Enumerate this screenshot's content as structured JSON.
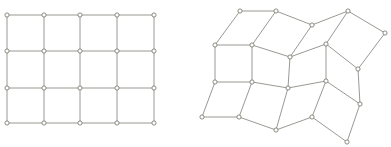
{
  "figure": {
    "title": "Regular grid mesh and its deformed counterpart",
    "background_color": "#ffffff",
    "edge_color": "#8d8d87",
    "node_stroke_color": "#78786f",
    "node_fill_color": "#ffffff",
    "node_radius": 2.1,
    "edge_width": 0.9,
    "width": 391,
    "height": 147
  },
  "panels": [
    {
      "id": "undeformed-grid",
      "label": "Undeformed regular grid",
      "rows": 4,
      "cols": 5,
      "cells": "4 x 3",
      "node_count": 20,
      "nodes": [
        [
          7,
          15
        ],
        [
          44,
          15
        ],
        [
          80,
          15
        ],
        [
          117,
          15
        ],
        [
          154,
          15
        ],
        [
          7,
          51
        ],
        [
          44,
          51
        ],
        [
          80,
          51
        ],
        [
          117,
          51
        ],
        [
          154,
          51
        ],
        [
          7,
          88
        ],
        [
          44,
          88
        ],
        [
          80,
          88
        ],
        [
          117,
          88
        ],
        [
          154,
          88
        ],
        [
          7,
          123
        ],
        [
          44,
          123
        ],
        [
          80,
          123
        ],
        [
          117,
          123
        ],
        [
          154,
          123
        ]
      ]
    },
    {
      "id": "deformed-grid",
      "label": "Deformed warped grid",
      "rows": 4,
      "cols": 5,
      "cells": "4 x 3",
      "node_count": 20,
      "nodes": [
        [
          240,
          11
        ],
        [
          276,
          11
        ],
        [
          312,
          25
        ],
        [
          348,
          11
        ],
        [
          385,
          33
        ],
        [
          215,
          45
        ],
        [
          252,
          45
        ],
        [
          290,
          57
        ],
        [
          326,
          44
        ],
        [
          358,
          69
        ],
        [
          215,
          82
        ],
        [
          252,
          82
        ],
        [
          288,
          88
        ],
        [
          326,
          81
        ],
        [
          360,
          104
        ],
        [
          202,
          117
        ],
        [
          239,
          117
        ],
        [
          276,
          130
        ],
        [
          312,
          117
        ],
        [
          347,
          142
        ]
      ]
    }
  ],
  "chart_data": {
    "type": "scatter",
    "title": "Regular grid mesh and its deformed counterpart",
    "xlabel": "",
    "ylabel": "",
    "xlim": [
      0,
      391
    ],
    "ylim": [
      0,
      147
    ],
    "grid": false,
    "legend": "none",
    "series": [
      {
        "name": "Undeformed regular grid",
        "values": [
          [
            7,
            15
          ],
          [
            44,
            15
          ],
          [
            80,
            15
          ],
          [
            117,
            15
          ],
          [
            154,
            15
          ],
          [
            7,
            51
          ],
          [
            44,
            51
          ],
          [
            80,
            51
          ],
          [
            117,
            51
          ],
          [
            154,
            51
          ],
          [
            7,
            88
          ],
          [
            44,
            88
          ],
          [
            80,
            88
          ],
          [
            117,
            88
          ],
          [
            154,
            88
          ],
          [
            7,
            123
          ],
          [
            44,
            123
          ],
          [
            80,
            123
          ],
          [
            117,
            123
          ],
          [
            154,
            123
          ]
        ]
      },
      {
        "name": "Deformed warped grid",
        "values": [
          [
            240,
            11
          ],
          [
            276,
            11
          ],
          [
            312,
            25
          ],
          [
            348,
            11
          ],
          [
            385,
            33
          ],
          [
            215,
            45
          ],
          [
            252,
            45
          ],
          [
            290,
            57
          ],
          [
            326,
            44
          ],
          [
            358,
            69
          ],
          [
            215,
            82
          ],
          [
            252,
            82
          ],
          [
            288,
            88
          ],
          [
            326,
            81
          ],
          [
            360,
            104
          ],
          [
            202,
            117
          ],
          [
            239,
            117
          ],
          [
            276,
            130
          ],
          [
            312,
            117
          ],
          [
            347,
            142
          ]
        ]
      }
    ]
  }
}
